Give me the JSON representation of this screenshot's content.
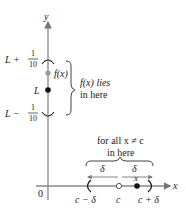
{
  "diagram": {
    "axes": {
      "y_label": "y",
      "x_label": "x",
      "origin_label": "0",
      "axis_color": "#888888"
    },
    "y_axis_labels": {
      "upper": {
        "prefix": "L + ",
        "num": "1",
        "den": "10"
      },
      "middle": "L",
      "lower": {
        "prefix": "L − ",
        "num": "1",
        "den": "10"
      }
    },
    "point_labels": {
      "fx": "f(x)",
      "x_point": "x"
    },
    "annotations": {
      "fx_lies_line1": "f(x) lies",
      "fx_lies_line2": "in here",
      "for_all_line1": "for all x ≠ c",
      "for_all_line2": "in here",
      "delta_left": "δ",
      "delta_right": "δ"
    },
    "x_axis_labels": {
      "left": "c − δ",
      "center": "c",
      "right": "c + δ"
    },
    "colors": {
      "line": "#555555",
      "point_filled": "#111111",
      "point_gray": "#999999",
      "text": "#222222"
    }
  }
}
